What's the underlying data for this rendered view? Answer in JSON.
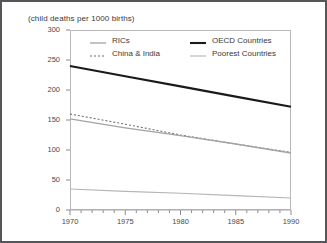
{
  "figure": {
    "title": "(child deaths per 1000 births)",
    "border_color": "#55565a",
    "plot_frame_color": "#b9b9bb"
  },
  "chart_data": {
    "type": "line",
    "title": "(child deaths per 1000 births)",
    "xlabel": "",
    "ylabel": "child deaths per 1000 births",
    "xlim": [
      1970,
      1990
    ],
    "ylim": [
      0,
      300
    ],
    "xticks": [
      1970,
      1975,
      1980,
      1985,
      1990
    ],
    "xtick_labels": [
      "1970",
      "1975",
      "1980",
      "1985",
      "1990"
    ],
    "x_minor_tick_step": 1,
    "yticks": [
      0,
      50,
      100,
      150,
      200,
      250,
      300
    ],
    "ytick_labels": [
      "0",
      "50",
      "100",
      "150",
      "200",
      "250",
      "300"
    ],
    "grid": false,
    "legend_position": "top-inside",
    "x": [
      1970,
      1975,
      1980,
      1985,
      1990
    ],
    "series": [
      {
        "name": "OECD Countries",
        "values": [
          240,
          223,
          206,
          189,
          172
        ],
        "color": "#1a1a1a",
        "width": 2.1,
        "dash": "none"
      },
      {
        "name": "China & India",
        "values": [
          160,
          143,
          125,
          110,
          96
        ],
        "color": "#6f6f72",
        "width": 1.1,
        "dash": "2,2"
      },
      {
        "name": "RICs",
        "values": [
          152,
          137,
          124,
          110,
          95
        ],
        "color": "#a3a3a6",
        "width": 1.3,
        "dash": "none"
      },
      {
        "name": "Poorest Countries",
        "values": [
          35,
          31,
          28,
          24,
          20
        ],
        "color": "#b5b5b8",
        "width": 1.1,
        "dash": "none"
      }
    ]
  },
  "legend": {
    "items": [
      {
        "label": "RICs",
        "series": "RICs"
      },
      {
        "label": "China & India",
        "series": "China & India"
      },
      {
        "label": "OECD Countries",
        "series": "OECD Countries"
      },
      {
        "label": "Poorest Countries",
        "series": "Poorest Countries"
      }
    ]
  }
}
